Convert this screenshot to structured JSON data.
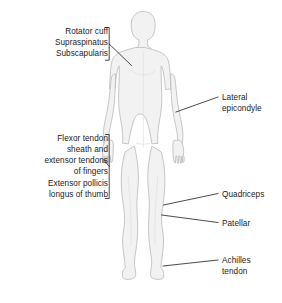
{
  "figure": {
    "background_color": "#ffffff",
    "body_fill_color": "#f2f2f2",
    "body_outline_color": "#b9b9b9",
    "leader_line_color": "#2b2b2b",
    "text_color": "#1b1b1b",
    "view": "anterior full-body silhouette"
  },
  "labels": {
    "left": [
      {
        "id": "rotator-cuff-group",
        "text": "Rotator cuff\nSupraspinatus\nSubscapularis",
        "lines": [
          "Rotator cuff",
          "Supraspinatus",
          "Subscapularis"
        ],
        "bracket": "right",
        "points_to": "shoulder"
      },
      {
        "id": "flexor-tendon-group",
        "text": "Flexor tendon\nsheath and\nextensor tendons\nof fingers",
        "lines": [
          "Flexor tendon",
          "sheath and",
          "extensor tendons",
          "of fingers"
        ],
        "bracket": "right",
        "points_to": "hand"
      },
      {
        "id": "extensor-pollicis-group",
        "text": "Extensor pollicis\nlongus of thumb",
        "lines": [
          "Extensor pollicis",
          "longus of thumb"
        ],
        "bracket": "right",
        "points_to": "thumb"
      }
    ],
    "right": [
      {
        "id": "lateral-epicondyle",
        "text": "Lateral\nepicondyle",
        "lines": [
          "Lateral",
          "epicondyle"
        ],
        "points_to": "elbow"
      },
      {
        "id": "quadriceps",
        "text": "Quadriceps",
        "lines": [
          "Quadriceps"
        ],
        "points_to": "thigh-above-knee"
      },
      {
        "id": "patellar",
        "text": "Patellar",
        "lines": [
          "Patellar"
        ],
        "points_to": "knee"
      },
      {
        "id": "achilles-tendon",
        "text": "Achilles\ntendon",
        "lines": [
          "Achilles",
          "tendon"
        ],
        "points_to": "ankle"
      }
    ]
  }
}
